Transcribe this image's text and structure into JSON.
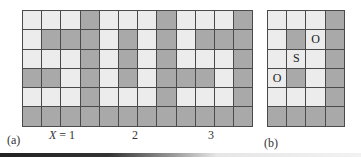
{
  "colors": {
    "light": "#ececec",
    "dark": "#a9a9a9",
    "line": "#4a4a4a"
  },
  "panel_a": {
    "label": "(a)",
    "x_label_prefix": "X",
    "x_ticks": [
      "= 1",
      "2",
      "3"
    ],
    "rows": [
      "LLLDLLLDLLLD",
      "LDDDLDLDLDDD",
      "LLLDLDLDLLLD",
      "DDLDLDLDDDLD",
      "LLLDLLLDLLLD",
      "DDDDDDDDDDDD"
    ]
  },
  "panel_b": {
    "label": "(b)",
    "rows": [
      "LLLD",
      "LDLD",
      "LLLD",
      "LDLD",
      "LLLD",
      "DDDD"
    ],
    "markers": [
      {
        "row": 1,
        "col": 2,
        "text": "O"
      },
      {
        "row": 2,
        "col": 1,
        "text": "S"
      },
      {
        "row": 3,
        "col": 0,
        "text": "O"
      }
    ]
  }
}
